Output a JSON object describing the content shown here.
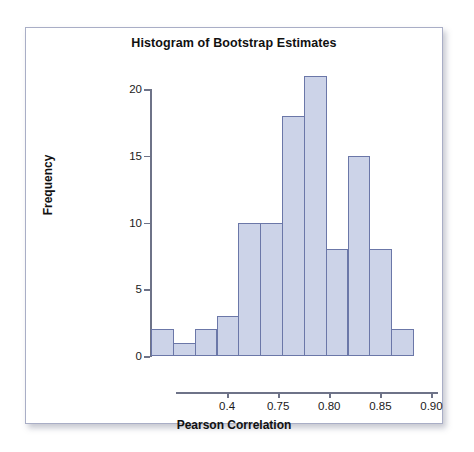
{
  "chart_data": {
    "type": "bar",
    "title": "Histogram of Bootstrap Estimates",
    "xlabel": "Pearson Correlation",
    "ylabel": "Frequency",
    "values": [
      2,
      1,
      2,
      3,
      10,
      10,
      18,
      21,
      8,
      15,
      8,
      2
    ],
    "categories": [
      "1",
      "2",
      "3",
      "4",
      "5",
      "6",
      "7",
      "8",
      "9",
      "10",
      "11",
      "12"
    ],
    "bin_count": 12,
    "ylim": [
      0,
      21
    ],
    "y_ticks": [
      0,
      5,
      10,
      15,
      20
    ],
    "y_tick_labels": [
      "0",
      "5",
      "10",
      "15",
      "20"
    ],
    "x_tick_labels": [
      "0.4",
      "0.75",
      "0.80",
      "0.85",
      "0.90"
    ],
    "x_tick_positions": [
      0.195,
      0.39,
      0.585,
      0.78,
      0.975
    ],
    "grid": false,
    "legend": "none",
    "bar_fill_color": "#ccd3e8",
    "bar_border_color": "#6b77a8",
    "axis_color": "#6e7388",
    "plot_background": "#ffffff",
    "frame_color": "#a9aec6"
  }
}
